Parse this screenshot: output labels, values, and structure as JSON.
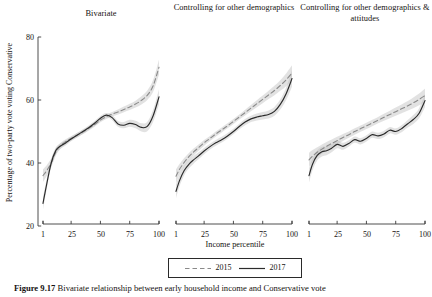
{
  "figure": {
    "y_axis_label": "Percentage of two-party vote voting Conservative",
    "x_axis_label": "Income percentile",
    "caption_number": "Figure 9.17",
    "caption_text": "Bivariate relationship between early household income and Conservative vote"
  },
  "legend": {
    "items": [
      {
        "label": "2015",
        "style": "dashed",
        "color": "#8a8a8a"
      },
      {
        "label": "2017",
        "style": "solid",
        "color": "#2b2b2b"
      }
    ]
  },
  "chart_data": {
    "type": "line",
    "title": "",
    "xlabel": "Income percentile",
    "ylabel": "Percentage of two-party vote voting Conservative",
    "xlim": [
      1,
      100
    ],
    "ylim": [
      20,
      80
    ],
    "xticks": [
      1,
      25,
      50,
      75,
      100
    ],
    "yticks": [
      20,
      40,
      60,
      80
    ],
    "grid": false,
    "legend_position": "bottom-center",
    "shared_y_axis": true,
    "confidence_band": true,
    "panels": [
      {
        "title": "Bivariate",
        "x": [
          1,
          4,
          8,
          12,
          16,
          20,
          25,
          30,
          35,
          40,
          45,
          50,
          55,
          60,
          65,
          70,
          75,
          80,
          85,
          90,
          95,
          100
        ],
        "series": [
          {
            "name": "2015",
            "style": "dashed",
            "values": [
              36.0,
              37.5,
              40.0,
              43.5,
              45.5,
              46.7,
              47.8,
              48.8,
              49.8,
              51.0,
              52.2,
              53.6,
              54.7,
              55.5,
              56.2,
              57.0,
              57.8,
              58.7,
              59.9,
              61.5,
              64.5,
              70.4
            ],
            "band_low": [
              34.0,
              35.8,
              38.6,
              42.4,
              44.6,
              45.9,
              47.1,
              48.1,
              49.1,
              50.3,
              51.5,
              52.9,
              54.0,
              54.8,
              55.4,
              56.1,
              56.8,
              57.6,
              58.6,
              60.0,
              62.6,
              68.0
            ],
            "band_high": [
              38.0,
              39.2,
              41.4,
              44.6,
              46.4,
              47.5,
              48.5,
              49.5,
              50.5,
              51.7,
              52.9,
              54.3,
              55.4,
              56.2,
              57.0,
              57.9,
              58.8,
              59.8,
              61.2,
              63.0,
              66.4,
              72.8
            ]
          },
          {
            "name": "2017",
            "style": "solid",
            "values": [
              27.2,
              33.0,
              40.0,
              44.0,
              45.4,
              46.3,
              47.6,
              48.8,
              50.0,
              51.2,
              52.6,
              54.2,
              55.2,
              54.4,
              52.4,
              52.0,
              52.6,
              52.2,
              51.3,
              51.6,
              55.0,
              61.0
            ],
            "band_low": [
              25.2,
              31.4,
              38.8,
              43.0,
              44.5,
              45.5,
              46.9,
              48.1,
              49.3,
              50.5,
              51.9,
              53.5,
              54.5,
              53.6,
              51.5,
              51.0,
              51.5,
              51.0,
              50.0,
              50.1,
              53.1,
              58.6
            ],
            "band_high": [
              29.2,
              34.6,
              41.2,
              45.0,
              46.3,
              47.1,
              48.3,
              49.5,
              50.7,
              51.9,
              53.3,
              54.9,
              55.9,
              55.2,
              53.3,
              53.0,
              53.7,
              53.4,
              52.6,
              53.1,
              56.9,
              63.4
            ]
          }
        ]
      },
      {
        "title": "Controlling for other demographics",
        "x": [
          1,
          4,
          8,
          12,
          16,
          20,
          25,
          30,
          35,
          40,
          45,
          50,
          55,
          60,
          65,
          70,
          75,
          80,
          85,
          90,
          95,
          100
        ],
        "series": [
          {
            "name": "2015",
            "style": "dashed",
            "values": [
              35.8,
              38.0,
              40.2,
              42.0,
              43.5,
              44.8,
              46.4,
              47.8,
              49.2,
              50.5,
              51.8,
              53.2,
              54.6,
              56.0,
              57.4,
              58.8,
              60.2,
              61.6,
              63.0,
              64.6,
              66.4,
              68.6
            ],
            "band_low": [
              33.6,
              36.3,
              38.8,
              40.8,
              42.4,
              43.8,
              45.5,
              47.0,
              48.4,
              49.7,
              51.0,
              52.4,
              53.8,
              55.1,
              56.4,
              57.7,
              59.0,
              60.3,
              61.5,
              62.9,
              64.4,
              66.2
            ],
            "band_high": [
              38.0,
              39.7,
              41.6,
              43.2,
              44.6,
              45.8,
              47.3,
              48.6,
              50.0,
              51.3,
              52.6,
              54.0,
              55.4,
              56.9,
              58.4,
              59.9,
              61.4,
              62.9,
              64.5,
              66.3,
              68.4,
              71.0
            ]
          },
          {
            "name": "2017",
            "style": "solid",
            "values": [
              31.0,
              34.4,
              37.6,
              39.6,
              41.0,
              42.2,
              43.8,
              45.2,
              46.4,
              47.4,
              48.6,
              50.0,
              51.6,
              53.0,
              54.0,
              54.6,
              55.0,
              55.4,
              56.4,
              58.6,
              62.0,
              66.8
            ],
            "band_low": [
              28.8,
              32.6,
              36.1,
              38.3,
              39.8,
              41.1,
              42.8,
              44.3,
              45.5,
              46.5,
              47.7,
              49.1,
              50.7,
              52.0,
              53.0,
              53.5,
              53.8,
              54.1,
              55.0,
              57.0,
              60.0,
              64.2
            ],
            "band_high": [
              33.2,
              36.2,
              39.1,
              40.9,
              42.2,
              43.3,
              44.8,
              46.1,
              47.3,
              48.3,
              49.5,
              50.9,
              52.5,
              54.0,
              55.0,
              55.7,
              56.2,
              56.7,
              57.8,
              60.2,
              64.0,
              69.4
            ]
          }
        ]
      },
      {
        "title": "Controlling for other demographics & attitudes",
        "x": [
          1,
          4,
          8,
          12,
          16,
          20,
          25,
          30,
          35,
          40,
          45,
          50,
          55,
          60,
          65,
          70,
          75,
          80,
          85,
          90,
          95,
          100
        ],
        "series": [
          {
            "name": "2015",
            "style": "dashed",
            "values": [
              41.0,
              42.2,
              43.4,
              44.4,
              45.3,
              46.1,
              47.1,
              48.1,
              49.0,
              50.0,
              50.9,
              51.8,
              52.7,
              53.6,
              54.5,
              55.4,
              56.3,
              57.2,
              58.1,
              59.1,
              60.2,
              61.4
            ],
            "band_low": [
              38.8,
              40.3,
              41.8,
              42.9,
              43.9,
              44.8,
              45.9,
              47.0,
              48.0,
              49.0,
              49.9,
              50.8,
              51.7,
              52.6,
              53.4,
              54.2,
              55.0,
              55.8,
              56.6,
              57.4,
              58.3,
              59.2
            ],
            "band_high": [
              43.2,
              44.1,
              45.0,
              45.9,
              46.7,
              47.4,
              48.3,
              49.2,
              50.0,
              51.0,
              51.9,
              52.8,
              53.7,
              54.6,
              55.6,
              56.6,
              57.6,
              58.6,
              59.6,
              60.8,
              62.1,
              63.6
            ]
          },
          {
            "name": "2017",
            "style": "solid",
            "values": [
              36.0,
              39.6,
              42.4,
              43.6,
              43.9,
              44.6,
              45.9,
              45.3,
              46.2,
              47.4,
              46.9,
              47.8,
              49.0,
              48.6,
              49.2,
              50.4,
              50.0,
              50.9,
              52.4,
              53.8,
              55.8,
              59.8
            ],
            "band_low": [
              33.8,
              37.7,
              40.8,
              42.1,
              42.5,
              43.3,
              44.7,
              44.2,
              45.2,
              46.4,
              45.9,
              46.8,
              48.0,
              47.6,
              48.2,
              49.4,
              49.0,
              49.8,
              51.2,
              52.4,
              54.2,
              57.8
            ],
            "band_high": [
              38.2,
              41.5,
              44.0,
              45.1,
              45.3,
              45.9,
              47.1,
              46.4,
              47.2,
              48.4,
              47.9,
              48.8,
              50.0,
              49.6,
              50.2,
              51.4,
              51.0,
              52.0,
              53.6,
              55.2,
              57.4,
              61.8
            ]
          }
        ]
      }
    ]
  }
}
